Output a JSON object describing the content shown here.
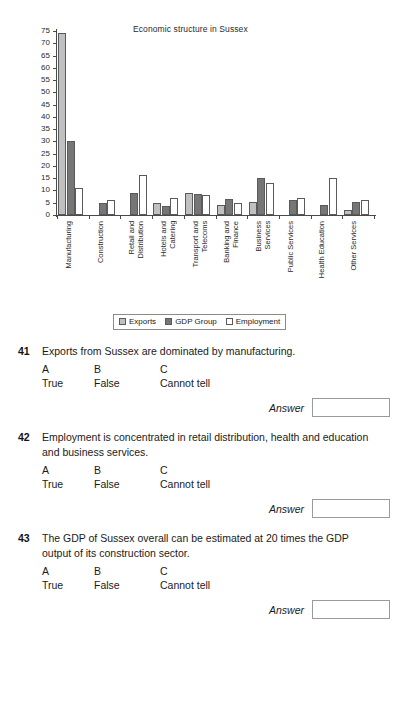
{
  "chart_data": {
    "type": "bar",
    "title": "Economic structure in Sussex",
    "xlabel": "",
    "ylabel": "",
    "ylim": [
      0,
      75
    ],
    "yticks": [
      0,
      5,
      10,
      15,
      20,
      25,
      30,
      35,
      40,
      45,
      50,
      55,
      60,
      65,
      70,
      75
    ],
    "grid": false,
    "legend_position": "bottom",
    "categories": [
      "Manufacturing",
      "Construction",
      "Retail and Distribution",
      "Hotels and Catering",
      "Transport and Telecoms",
      "Banking and Finance",
      "Business Services",
      "Public Services",
      "Health Education",
      "Other Services"
    ],
    "category_lines": [
      [
        "Manufacturing"
      ],
      [
        "Construction"
      ],
      [
        "Retail and",
        "Distribution"
      ],
      [
        "Hotels and",
        "Catering"
      ],
      [
        "Transport and",
        "Telecoms"
      ],
      [
        "Banking and",
        "Finance"
      ],
      [
        "Business",
        "Services"
      ],
      [
        "Public Services"
      ],
      [
        "Health Education"
      ],
      [
        "Other Services"
      ]
    ],
    "series": [
      {
        "name": "Exports",
        "color": "#c0c0c0",
        "values": [
          74,
          0,
          0,
          5,
          9,
          4,
          5.5,
          0,
          0,
          2
        ]
      },
      {
        "name": "GDP Group",
        "color": "#767676",
        "values": [
          30,
          5,
          9,
          3.5,
          8.5,
          6.5,
          15,
          6,
          4,
          5.5
        ]
      },
      {
        "name": "Employment",
        "color": "#ffffff",
        "values": [
          11,
          6,
          16.5,
          7,
          8,
          5,
          13,
          7,
          15,
          6
        ]
      }
    ]
  },
  "questions": [
    {
      "number": "41",
      "text": "Exports from Sussex are dominated by manufacturing.",
      "options": [
        {
          "letter": "A",
          "word": "True"
        },
        {
          "letter": "B",
          "word": "False"
        },
        {
          "letter": "C",
          "word": "Cannot tell"
        }
      ],
      "answer_label": "Answer",
      "answer_value": ""
    },
    {
      "number": "42",
      "text": "Employment is concentrated in retail distribution, health and education and business services.",
      "options": [
        {
          "letter": "A",
          "word": "True"
        },
        {
          "letter": "B",
          "word": "False"
        },
        {
          "letter": "C",
          "word": "Cannot tell"
        }
      ],
      "answer_label": "Answer",
      "answer_value": ""
    },
    {
      "number": "43",
      "text": "The GDP of Sussex overall can be estimated at 20 times the GDP output of its construction sector.",
      "options": [
        {
          "letter": "A",
          "word": "True"
        },
        {
          "letter": "B",
          "word": "False"
        },
        {
          "letter": "C",
          "word": "Cannot tell"
        }
      ],
      "answer_label": "Answer",
      "answer_value": ""
    }
  ]
}
